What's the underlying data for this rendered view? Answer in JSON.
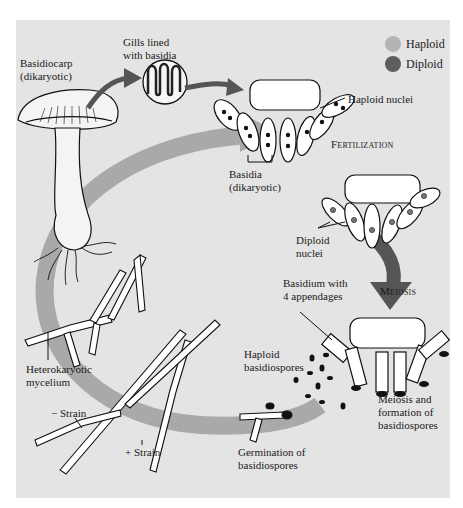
{
  "figure": {
    "legend": [
      {
        "label": "Haploid",
        "color": "#b4b4b4"
      },
      {
        "label": "Diploid",
        "color": "#5e5e5e"
      }
    ],
    "labels": {
      "basidiocarp": "Basidiocarp\n(dikaryotic)",
      "gills": "Gills lined\nwith basidia",
      "haploid_nuclei": "Haploid nuclei",
      "basidia": "Basidia\n(dikaryotic)",
      "fertilization": "Fertilization",
      "diploid_nuclei": "Diploid\nnuclei",
      "basidium_appendages": "Basidium with\n4 appendages",
      "meiosis": "Meiosis",
      "haploid_basidiospores": "Haploid\nbasidiospores",
      "meiosis_formation": "Meiosis and\nformation of\nbasidiospores",
      "heterokaryotic_mycelium": "Heterokaryotic\nmycelium",
      "minus_strain": "− Strain",
      "plus_strain": "+ Strain",
      "germination": "Germination of\nbasidiospores"
    },
    "colors": {
      "panel_background": "#e4e4e4",
      "cycle_arrow": "#a9a9a9",
      "dark_arrow": "#555555"
    }
  }
}
